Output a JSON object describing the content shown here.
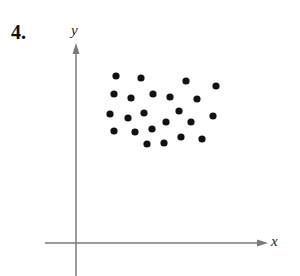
{
  "problem": {
    "number": "4."
  },
  "axes": {
    "x_label": "x",
    "y_label": "y",
    "color": "#7a7a7a",
    "origin_px": [
      76,
      243
    ],
    "x_axis": {
      "start_px": 45,
      "end_px": 268
    },
    "y_axis": {
      "start_px": 276,
      "end_px": 43
    }
  },
  "chart_data": {
    "type": "scatter",
    "title": "",
    "xlabel": "x",
    "ylabel": "y",
    "grid": false,
    "ticks": "none",
    "point_color": "#111111",
    "points_px": [
      [
        116,
        76
      ],
      [
        141,
        78
      ],
      [
        186,
        81
      ],
      [
        216,
        86
      ],
      [
        114,
        94
      ],
      [
        131,
        98
      ],
      [
        153,
        94
      ],
      [
        170,
        97
      ],
      [
        197,
        99
      ],
      [
        110,
        114
      ],
      [
        128,
        118
      ],
      [
        144,
        113
      ],
      [
        179,
        111
      ],
      [
        213,
        116
      ],
      [
        166,
        122
      ],
      [
        191,
        122
      ],
      [
        114,
        131
      ],
      [
        135,
        132
      ],
      [
        152,
        129
      ],
      [
        147,
        144
      ],
      [
        164,
        143
      ],
      [
        181,
        137
      ],
      [
        202,
        139
      ]
    ]
  }
}
